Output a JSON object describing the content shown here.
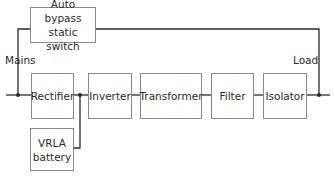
{
  "diagram": {
    "colors": {
      "line": "#2a2a2a",
      "box_border": "#8a8a8a",
      "text": "#2a2a2a"
    },
    "labels": {
      "mains": "Mains",
      "load": "Load"
    },
    "blocks": {
      "bypass": "Auto bypass static switch",
      "rectifier": "Rectifier",
      "inverter": "Inverter",
      "transformer": "Transformer",
      "filter": "Filter",
      "isolator": "Isolator",
      "battery": "VRLA battery"
    },
    "chain": [
      "Rectifier",
      "Inverter",
      "Transformer",
      "Filter",
      "Isolator"
    ]
  }
}
